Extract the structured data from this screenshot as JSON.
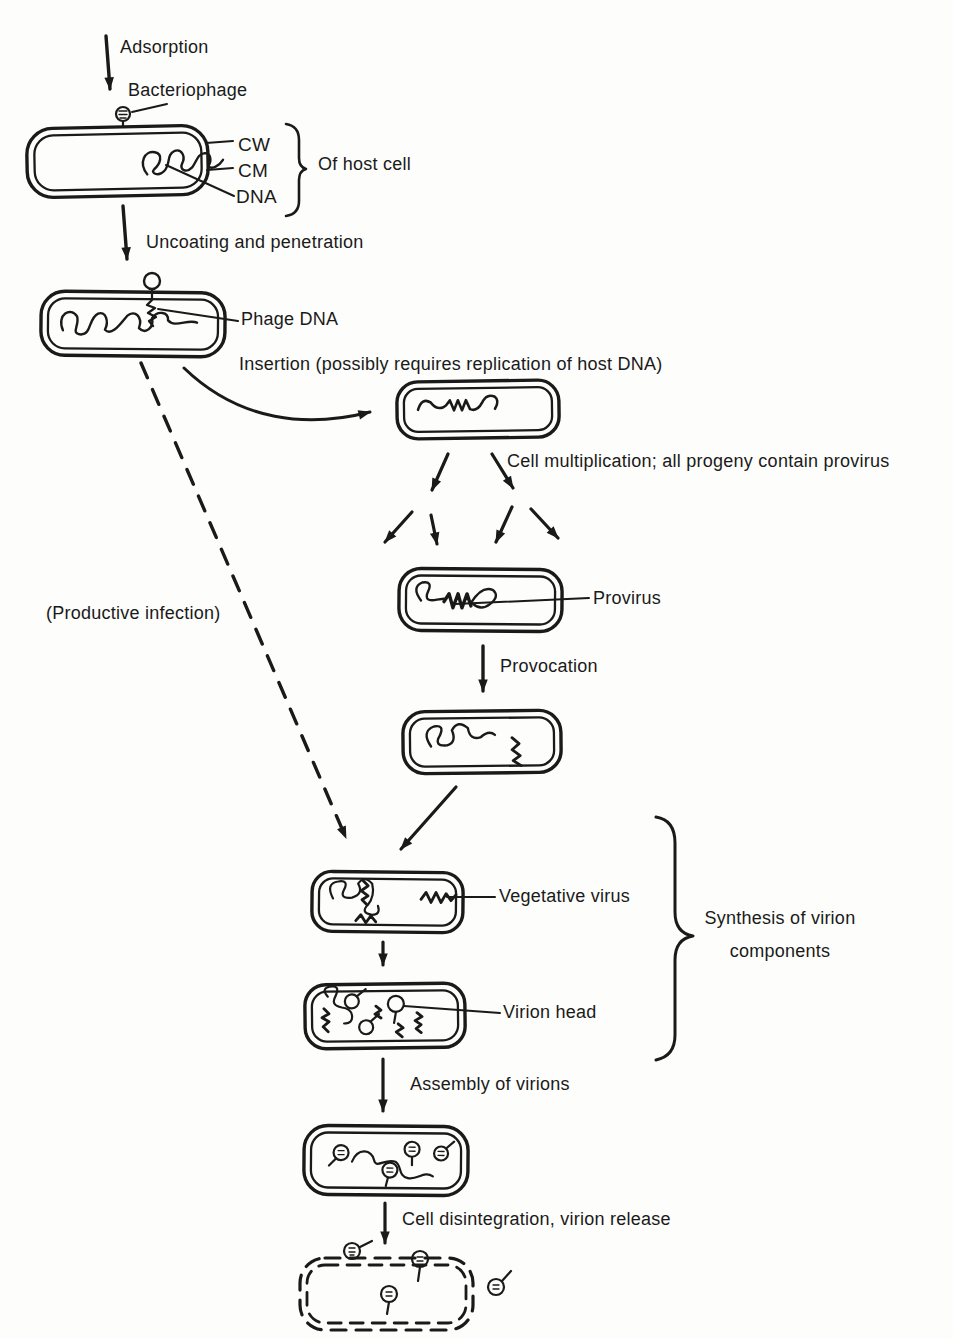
{
  "diagram": {
    "colors": {
      "ink": "#1a1a1a",
      "background": "#fdfdfb"
    },
    "labels": {
      "adsorption": "Adsorption",
      "bacteriophage": "Bacteriophage",
      "cw": "CW",
      "cm": "CM",
      "dna": "DNA",
      "of_host_cell": "Of host cell",
      "uncoating": "Uncoating and penetration",
      "phage_dna": "Phage DNA",
      "insertion": "Insertion (possibly requires replication of host DNA)",
      "cell_multiplication": "Cell multiplication; all progeny contain provirus",
      "provirus": "Provirus",
      "provocation": "Provocation",
      "productive_infection": "(Productive infection)",
      "vegetative_virus": "Vegetative virus",
      "synthesis_line1": "Synthesis of virion",
      "synthesis_line2": "components",
      "virion_head": "Virion head",
      "assembly": "Assembly of virions",
      "cell_disintegration": "Cell disintegration, virion release"
    }
  }
}
